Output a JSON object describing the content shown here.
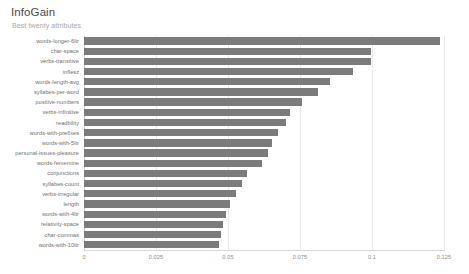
{
  "header": {
    "title": "InfoGain",
    "subtitle": "Best twenty attributes"
  },
  "axis": {
    "tick_labels": [
      "0",
      "0.025",
      "0.05",
      "0.075",
      "0.1",
      "0.125"
    ],
    "tick_values": [
      0,
      0.025,
      0.05,
      0.075,
      0.1,
      0.125
    ]
  },
  "colors": {
    "bar": "#7b7b7b",
    "grid": "#e9e9e9",
    "title": "#4a4a4a",
    "subtitle": "#a8a8a8",
    "label": "#6f6f6f"
  },
  "chart_data": {
    "type": "bar",
    "orientation": "horizontal",
    "title": "InfoGain",
    "subtitle": "Best twenty attributes",
    "xlabel": "",
    "ylabel": "",
    "xlim": [
      0,
      0.125
    ],
    "grid": true,
    "legend": false,
    "categories": [
      "words-longer-6ltr",
      "char-space",
      "verbs-transitive",
      "inflesz",
      "words-length-avg",
      "syllabes-per-word",
      "positive-numbers",
      "verbs-infinitive",
      "readbility",
      "words-with-prefixes",
      "words-with-5ltr",
      "personal-issues-pleasure",
      "words-fememine",
      "conjunctions",
      "syllabes-count",
      "verbs-irregular",
      "length",
      "words-with-4ltr",
      "relativity-space",
      "char-commas",
      "words-with-10ltr"
    ],
    "values": [
      0.1236,
      0.0997,
      0.0997,
      0.0934,
      0.0854,
      0.0812,
      0.0757,
      0.0715,
      0.0701,
      0.0674,
      0.0653,
      0.0639,
      0.0618,
      0.0566,
      0.0549,
      0.0528,
      0.0507,
      0.0493,
      0.0483,
      0.0476,
      0.0469
    ]
  }
}
